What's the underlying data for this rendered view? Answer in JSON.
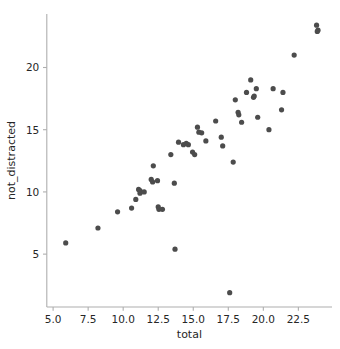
{
  "chart_data": {
    "type": "scatter",
    "title": "",
    "xlabel": "total",
    "ylabel": "not_distracted",
    "xlim": [
      4.55,
      24.9
    ],
    "ylim": [
      0.75,
      24.3
    ],
    "grid": false,
    "legend": null,
    "marker_color": "#4c4c4c",
    "spine_color": "#aeaeae",
    "text_color": "#262626",
    "xticks": [
      5.0,
      7.5,
      10.0,
      12.5,
      15.0,
      17.5,
      20.0,
      22.5
    ],
    "xticklabels": [
      "5.0",
      "7.5",
      "10.0",
      "12.5",
      "15.0",
      "17.5",
      "20.0",
      "22.5"
    ],
    "yticks": [
      5,
      10,
      15,
      20
    ],
    "yticklabels": [
      "5",
      "10",
      "15",
      "20"
    ],
    "n_points": 52,
    "points": [
      {
        "x": 5.9,
        "y": 5.9
      },
      {
        "x": 8.2,
        "y": 7.1
      },
      {
        "x": 9.6,
        "y": 8.4
      },
      {
        "x": 10.6,
        "y": 8.7
      },
      {
        "x": 10.9,
        "y": 9.4
      },
      {
        "x": 11.1,
        "y": 10.2
      },
      {
        "x": 11.2,
        "y": 9.9
      },
      {
        "x": 11.2,
        "y": 10.1
      },
      {
        "x": 11.5,
        "y": 10.0
      },
      {
        "x": 12.0,
        "y": 11.0
      },
      {
        "x": 12.1,
        "y": 10.8
      },
      {
        "x": 12.15,
        "y": 12.1
      },
      {
        "x": 12.45,
        "y": 10.9
      },
      {
        "x": 12.5,
        "y": 8.8
      },
      {
        "x": 12.55,
        "y": 8.6
      },
      {
        "x": 12.8,
        "y": 8.6
      },
      {
        "x": 13.4,
        "y": 13.0
      },
      {
        "x": 13.65,
        "y": 10.7
      },
      {
        "x": 13.7,
        "y": 5.4
      },
      {
        "x": 13.95,
        "y": 14.0
      },
      {
        "x": 14.3,
        "y": 13.8
      },
      {
        "x": 14.5,
        "y": 13.9
      },
      {
        "x": 14.65,
        "y": 13.8
      },
      {
        "x": 14.95,
        "y": 13.2
      },
      {
        "x": 15.1,
        "y": 13.0
      },
      {
        "x": 15.3,
        "y": 15.2
      },
      {
        "x": 15.4,
        "y": 14.8
      },
      {
        "x": 15.6,
        "y": 14.75
      },
      {
        "x": 15.9,
        "y": 14.1
      },
      {
        "x": 16.6,
        "y": 15.7
      },
      {
        "x": 17.0,
        "y": 14.4
      },
      {
        "x": 17.1,
        "y": 13.7
      },
      {
        "x": 17.6,
        "y": 1.9
      },
      {
        "x": 17.85,
        "y": 12.4
      },
      {
        "x": 18.0,
        "y": 17.4
      },
      {
        "x": 18.2,
        "y": 16.4
      },
      {
        "x": 18.25,
        "y": 16.2
      },
      {
        "x": 18.45,
        "y": 15.6
      },
      {
        "x": 18.8,
        "y": 18.0
      },
      {
        "x": 19.1,
        "y": 19.0
      },
      {
        "x": 19.3,
        "y": 17.6
      },
      {
        "x": 19.35,
        "y": 17.7
      },
      {
        "x": 19.5,
        "y": 18.3
      },
      {
        "x": 19.6,
        "y": 16.0
      },
      {
        "x": 20.4,
        "y": 15.0
      },
      {
        "x": 20.7,
        "y": 18.3
      },
      {
        "x": 21.3,
        "y": 16.6
      },
      {
        "x": 21.4,
        "y": 18.0
      },
      {
        "x": 22.2,
        "y": 21.0
      },
      {
        "x": 23.8,
        "y": 23.4
      },
      {
        "x": 23.85,
        "y": 22.9
      },
      {
        "x": 23.9,
        "y": 23.0
      }
    ]
  }
}
